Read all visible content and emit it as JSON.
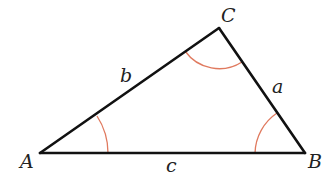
{
  "diagram": {
    "colors": {
      "background": "#ffffff",
      "sides": "#111111",
      "angle_arcs": "#e07a5f",
      "labels": "#222222"
    },
    "vertices": {
      "A": {
        "label": "A",
        "x": 40,
        "y": 153,
        "label_x": 20,
        "label_y": 168
      },
      "B": {
        "label": "B",
        "x": 305,
        "y": 153,
        "label_x": 308,
        "label_y": 168
      },
      "C": {
        "label": "C",
        "x": 219,
        "y": 28,
        "label_x": 221,
        "label_y": 22
      }
    },
    "sides": {
      "a": {
        "label": "a",
        "from": "B",
        "to": "C",
        "label_x": 272,
        "label_y": 93
      },
      "b": {
        "label": "b",
        "from": "A",
        "to": "C",
        "label_x": 120,
        "label_y": 82
      },
      "c": {
        "label": "c",
        "from": "A",
        "to": "B",
        "label_x": 166,
        "label_y": 172
      }
    },
    "angle_marks": [
      {
        "vertex": "A",
        "radius": 68
      },
      {
        "vertex": "B",
        "radius": 50
      },
      {
        "vertex": "C",
        "radius": 42
      }
    ]
  }
}
